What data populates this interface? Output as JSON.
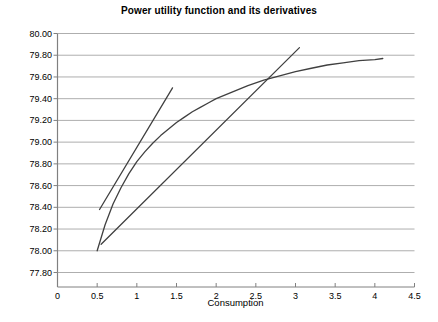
{
  "chart_data": {
    "type": "line",
    "title": "Power utility function and its derivatives",
    "xlabel": "Consumption",
    "ylabel": "",
    "xlim": [
      0,
      4.5
    ],
    "ylim": [
      77.8,
      80.0
    ],
    "grid": "horizontal",
    "legend": "none",
    "xticks": [
      "0",
      "0.5",
      "1",
      "1.5",
      "2",
      "2.5",
      "3",
      "3.5",
      "4",
      "4.5"
    ],
    "xtick_values": [
      0,
      0.5,
      1,
      1.5,
      2,
      2.5,
      3,
      3.5,
      4,
      4.5
    ],
    "yticks": [
      "77.80",
      "78.00",
      "78.20",
      "78.40",
      "78.60",
      "78.80",
      "79.00",
      "79.20",
      "79.40",
      "79.60",
      "79.80",
      "80.00"
    ],
    "ytick_values": [
      77.8,
      78.0,
      78.2,
      78.4,
      78.6,
      78.8,
      79.0,
      79.2,
      79.4,
      79.6,
      79.8,
      80.0
    ],
    "series": [
      {
        "name": "power-utility-function",
        "type": "line",
        "color": "#404040",
        "x": [
          0.5,
          0.6,
          0.7,
          0.8,
          0.9,
          1.0,
          1.1,
          1.2,
          1.3,
          1.4,
          1.5,
          1.6,
          1.7,
          1.8,
          1.9,
          2.0,
          2.2,
          2.4,
          2.6,
          2.8,
          3.0,
          3.2,
          3.4,
          3.6,
          3.8,
          4.0,
          4.1
        ],
        "y": [
          78.0,
          78.24,
          78.43,
          78.58,
          78.71,
          78.82,
          78.91,
          78.99,
          79.06,
          79.12,
          79.18,
          79.23,
          79.28,
          79.32,
          79.36,
          79.4,
          79.46,
          79.52,
          79.57,
          79.61,
          79.65,
          79.68,
          79.71,
          79.73,
          79.75,
          79.76,
          79.77
        ]
      },
      {
        "name": "tangent-line-at-c-1",
        "type": "line",
        "color": "#404040",
        "x": [
          0.53,
          1.45
        ],
        "y": [
          78.38,
          79.5
        ]
      },
      {
        "name": "tangent-line-at-c-2",
        "type": "line",
        "color": "#404040",
        "x": [
          0.55,
          3.05
        ],
        "y": [
          78.06,
          79.87
        ]
      }
    ]
  },
  "axes": {
    "y_axis_color": "#808080",
    "grid_color": "#999999",
    "x_axis_color": "#808080"
  }
}
